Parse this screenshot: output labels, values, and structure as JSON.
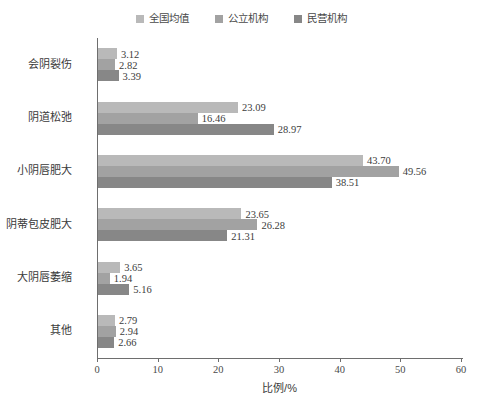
{
  "chart_data": {
    "type": "bar",
    "orientation": "horizontal",
    "title": "",
    "xlabel": "比例/%",
    "ylabel": "",
    "xlim": [
      0,
      60
    ],
    "xticks": [
      0,
      10,
      20,
      30,
      40,
      50,
      60
    ],
    "grid": false,
    "legend_position": "top-center",
    "categories": [
      "会阴裂伤",
      "阴道松弛",
      "小阴唇肥大",
      "阴蒂包皮肥大",
      "大阴唇萎缩",
      "其他"
    ],
    "series": [
      {
        "name": "全国均值",
        "color": "#b9b9b9",
        "values": [
          3.12,
          23.09,
          43.7,
          23.65,
          3.65,
          2.79
        ],
        "labels": [
          "3.12",
          "23.09",
          "43.70",
          "23.65",
          "3.65",
          "2.79"
        ]
      },
      {
        "name": "公立机构",
        "color": "#a2a2a2",
        "values": [
          2.82,
          16.46,
          49.56,
          26.28,
          1.94,
          2.94
        ],
        "labels": [
          "2.82",
          "16.46",
          "49.56",
          "26.28",
          "1.94",
          "2.94"
        ]
      },
      {
        "name": "民营机构",
        "color": "#878787",
        "values": [
          3.39,
          28.97,
          38.51,
          21.31,
          5.16,
          2.66
        ],
        "labels": [
          "3.39",
          "28.97",
          "38.51",
          "21.31",
          "5.16",
          "2.66"
        ]
      }
    ]
  },
  "axis": {
    "x_tick_labels": [
      "0",
      "10",
      "20",
      "30",
      "40",
      "50",
      "60"
    ],
    "x_title": "比例/%"
  },
  "legend": {
    "items": [
      {
        "label": "全国均值",
        "color": "#b9b9b9"
      },
      {
        "label": "公立机构",
        "color": "#a2a2a2"
      },
      {
        "label": "民营机构",
        "color": "#878787"
      }
    ]
  },
  "caption": {
    "text": ""
  }
}
